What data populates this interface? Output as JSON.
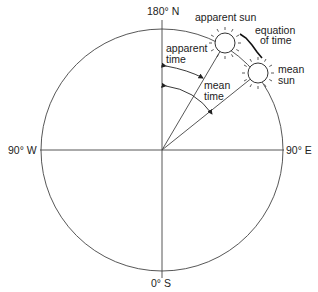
{
  "diagram": {
    "compass": {
      "north": "180° N",
      "south": "0° S",
      "west": "90° W",
      "east": "90° E"
    },
    "suns": {
      "apparent": "apparent sun",
      "mean_line1": "mean",
      "mean_line2": "sun"
    },
    "equation": {
      "line1": "equation",
      "line2": "of time"
    },
    "angles": {
      "apparent_line1": "apparent",
      "apparent_line2": "time",
      "mean_line1": "mean",
      "mean_line2": "time"
    },
    "colors": {
      "line": "#333333",
      "background": "#ffffff"
    }
  }
}
